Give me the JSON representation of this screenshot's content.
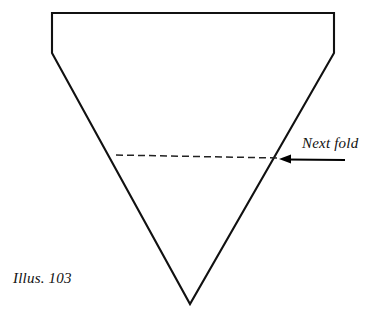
{
  "figure": {
    "caption": "Illus. 103",
    "annotation_label": "Next fold",
    "alt_description": "Origami diagram: a paper shape folded into a downward-pointing triangle with a flat top edge and two short vertical sides, with a dashed horizontal line marking the next fold.",
    "colors": {
      "background": "#ffffff",
      "outline": "#111111",
      "dashed_fold_line": "#222222",
      "arrow": "#000000",
      "text": "#111111"
    },
    "geometry": {
      "shape_name": "folded-paper-triangle",
      "outline_points": "52,13 334,13 334,53 190,304 52,53",
      "top_edge": {
        "x1": 52,
        "y1": 13,
        "x2": 334,
        "y2": 13
      },
      "left_vertical_edge": {
        "x1": 52,
        "y1": 13,
        "x2": 52,
        "y2": 53
      },
      "right_vertical_edge": {
        "x1": 334,
        "y1": 13,
        "x2": 334,
        "y2": 53
      },
      "left_diagonal_edge": {
        "x1": 52,
        "y1": 53,
        "x2": 190,
        "y2": 304
      },
      "right_diagonal_edge": {
        "x1": 334,
        "y1": 53,
        "x2": 190,
        "y2": 304
      },
      "apex": {
        "x": 190,
        "y": 304
      },
      "dashed_fold_line": {
        "x1": 116,
        "y1": 155,
        "x2": 278,
        "y2": 158
      },
      "dash_pattern": "7 4",
      "arrow": {
        "tail_x": 345,
        "tail_y": 160,
        "tip_x": 279,
        "tip_y": 159
      },
      "stroke_width_outline": 2.1,
      "stroke_width_dashed": 1.5,
      "stroke_width_arrow": 2.0
    }
  }
}
